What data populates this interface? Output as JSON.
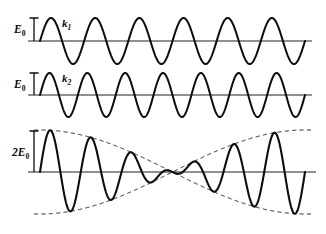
{
  "figure": {
    "background_color": "#ffffff",
    "curve_color": "#0d0d0d",
    "axis_color": "#6b6b6b",
    "envelope_color": "#1a1a1a",
    "width": 326,
    "height": 234
  },
  "panels": [
    {
      "id": "wave-1",
      "amplitude_label": "E",
      "amplitude_sub": "0",
      "wave_label": "k",
      "wave_label_sub": "1",
      "baseline_y": 41,
      "x_start": 40,
      "x_end": 305,
      "axis_x_start": 28,
      "axis_x_end": 312,
      "cycles": 6,
      "amplitude_px": 23,
      "tick_x": 34,
      "tick_top": 18,
      "label_x": 14,
      "label_y": 33,
      "wave_label_x": 62,
      "wave_label_y": 27
    },
    {
      "id": "wave-2",
      "amplitude_label": "E",
      "amplitude_sub": "0",
      "wave_label": "k",
      "wave_label_sub": "2",
      "baseline_y": 95,
      "x_start": 40,
      "x_end": 305,
      "axis_x_start": 28,
      "axis_x_end": 312,
      "cycles": 7,
      "amplitude_px": 22,
      "tick_x": 34,
      "tick_top": 73,
      "label_x": 14,
      "label_y": 88,
      "wave_label_x": 62,
      "wave_label_y": 82
    },
    {
      "id": "beat-wave",
      "amplitude_label": "2E",
      "amplitude_sub": "0",
      "baseline_y": 172,
      "x_start": 40,
      "x_end": 305,
      "axis_x_start": 28,
      "axis_x_end": 316,
      "amplitude_px": 42,
      "tick_x": 34,
      "tick_top": 131,
      "label_x": 16,
      "label_y": 156,
      "envelope_node_x": 130,
      "envelope_peak_x": 215,
      "envelope_second_node_x": 297
    }
  ],
  "chart_data": {
    "type": "line",
    "xlabel": "",
    "ylabel": "",
    "grid": false,
    "legend_position": "inline",
    "series": [
      {
        "name": "k1",
        "label": "k₁",
        "panel": "wave-1",
        "waveform": "sine",
        "cycles_over_span": 6,
        "amplitude": 1.0,
        "amplitude_label": "E₀",
        "phase": 0,
        "style": "solid"
      },
      {
        "name": "k2",
        "label": "k₂",
        "panel": "wave-2",
        "waveform": "sine",
        "cycles_over_span": 7,
        "amplitude": 1.0,
        "amplitude_label": "E₀",
        "phase": 0,
        "style": "solid"
      },
      {
        "name": "sum",
        "label": "E₁ + E₂",
        "panel": "beat-wave",
        "waveform": "sum-of-sines",
        "cycles_over_span": 13,
        "amplitude": 2.0,
        "amplitude_label": "2E₀",
        "beat_cycles": 1,
        "style": "solid"
      },
      {
        "name": "envelope-upper",
        "label": "envelope",
        "panel": "beat-wave",
        "waveform": "cosine-envelope",
        "amplitude": 2.0,
        "style": "dashed"
      },
      {
        "name": "envelope-lower",
        "label": "envelope",
        "panel": "beat-wave",
        "waveform": "cosine-envelope",
        "amplitude": -2.0,
        "style": "dashed"
      }
    ],
    "annotations": [
      {
        "text": "E₀",
        "target": "wave-1",
        "role": "amplitude-scale"
      },
      {
        "text": "k₁",
        "target": "wave-1",
        "role": "wave-identifier"
      },
      {
        "text": "E₀",
        "target": "wave-2",
        "role": "amplitude-scale"
      },
      {
        "text": "k₂",
        "target": "wave-2",
        "role": "wave-identifier"
      },
      {
        "text": "2E₀",
        "target": "beat-wave",
        "role": "amplitude-scale"
      }
    ]
  }
}
